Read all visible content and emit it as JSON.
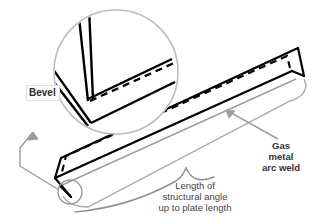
{
  "figure": {
    "background_color": "#ffffff",
    "line_color": "#000000",
    "leader_color": "#9a9a9a",
    "text_color": "#3b3b3b"
  },
  "detail_callout": {
    "name": "bevel-detail-circle",
    "shape": "circle",
    "center_x": 116,
    "center_y": 72,
    "radius": 62,
    "stroke_color": "#b5b5b5",
    "label": {
      "text": "Bevel",
      "boxed": true
    }
  },
  "source_callout": {
    "name": "bevel-source-circle",
    "shape": "circle",
    "center_x": 70,
    "center_y": 192,
    "radius": 12,
    "stroke_color": "#9a9a9a"
  },
  "labels": {
    "bevel": "Bevel",
    "gas_metal_arc_weld_lines": [
      "Gas",
      "metal",
      "arc weld"
    ],
    "gas_metal_arc_weld": "Gas metal arc weld",
    "length_lines": [
      "Length of",
      "structural angle",
      "up to plate length"
    ],
    "length": "Length of structural angle up to plate length"
  },
  "parts": {
    "structural_angle": "structural angle (L-section)",
    "weld_seam": "dashed weld seam line",
    "brace": "length dimension brace"
  }
}
